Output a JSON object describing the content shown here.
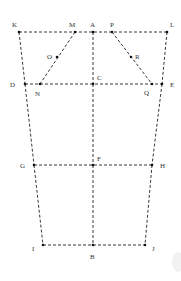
{
  "diagram": {
    "title": "",
    "colors": {
      "line": "#222222",
      "point": "#111111",
      "label": "#333333",
      "background": "#ffffff"
    },
    "points": [
      {
        "id": "K",
        "x": 19,
        "y": 32,
        "lx": 12,
        "ly": 27
      },
      {
        "id": "M",
        "x": 75,
        "y": 32,
        "lx": 69,
        "ly": 27
      },
      {
        "id": "A",
        "x": 93,
        "y": 32,
        "lx": 90,
        "ly": 27
      },
      {
        "id": "P",
        "x": 112,
        "y": 32,
        "lx": 110,
        "ly": 27
      },
      {
        "id": "L",
        "x": 167,
        "y": 32,
        "lx": 170,
        "ly": 27
      },
      {
        "id": "O",
        "x": 57,
        "y": 57,
        "lx": 47,
        "ly": 59
      },
      {
        "id": "R",
        "x": 131,
        "y": 57,
        "lx": 135,
        "ly": 59
      },
      {
        "id": "D",
        "x": 25,
        "y": 84,
        "lx": 10,
        "ly": 87
      },
      {
        "id": "N",
        "x": 40,
        "y": 84,
        "lx": 35,
        "ly": 96
      },
      {
        "id": "C",
        "x": 93,
        "y": 84,
        "lx": 97,
        "ly": 80
      },
      {
        "id": "Q",
        "x": 152,
        "y": 84,
        "lx": 144,
        "ly": 95
      },
      {
        "id": "E",
        "x": 162,
        "y": 84,
        "lx": 170,
        "ly": 87
      },
      {
        "id": "G",
        "x": 34,
        "y": 165,
        "lx": 20,
        "ly": 168
      },
      {
        "id": "F",
        "x": 93,
        "y": 165,
        "lx": 97,
        "ly": 161
      },
      {
        "id": "H",
        "x": 152,
        "y": 165,
        "lx": 160,
        "ly": 168
      },
      {
        "id": "I",
        "x": 43,
        "y": 245,
        "lx": 32,
        "ly": 251
      },
      {
        "id": "J",
        "x": 145,
        "y": 245,
        "lx": 152,
        "ly": 251
      },
      {
        "id": "B",
        "x": 93,
        "y": 245,
        "lx": 90,
        "ly": 259
      }
    ],
    "segments": [
      [
        "K",
        "L"
      ],
      [
        "D",
        "E"
      ],
      [
        "G",
        "H"
      ],
      [
        "I",
        "J"
      ],
      [
        "K",
        "D"
      ],
      [
        "D",
        "G"
      ],
      [
        "G",
        "I"
      ],
      [
        "L",
        "E"
      ],
      [
        "E",
        "H"
      ],
      [
        "H",
        "J"
      ],
      [
        "A",
        "C"
      ],
      [
        "C",
        "F"
      ],
      [
        "F",
        "B"
      ],
      [
        "M",
        "N"
      ],
      [
        "P",
        "Q"
      ]
    ],
    "labels": {
      "K": "K",
      "M": "M",
      "A": "A",
      "P": "P",
      "L": "L",
      "O": "O",
      "R": "R",
      "D": "D",
      "N": "N",
      "C": "C",
      "Q": "Q",
      "E": "E",
      "G": "G",
      "F": "F",
      "H": "H",
      "I": "I",
      "J": "J",
      "B": "B"
    }
  }
}
